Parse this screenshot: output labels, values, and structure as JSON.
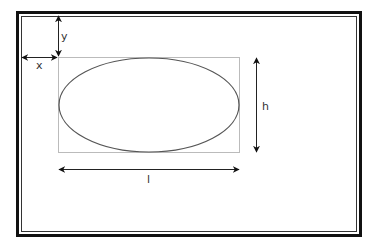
{
  "diagram": {
    "labels": {
      "x": "x",
      "y": "y",
      "h": "h",
      "l": "l"
    },
    "colors": {
      "frame": "#111111",
      "bbox": "#bbbbbb",
      "ellipse": "#555555",
      "arrow": "#222222"
    }
  }
}
